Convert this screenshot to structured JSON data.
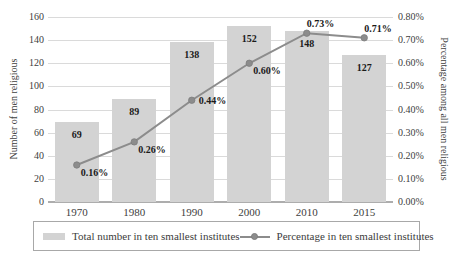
{
  "chart_data": {
    "type": "bar",
    "subtype": "bar-line-combo-dual-axis",
    "categories": [
      "1970",
      "1980",
      "1990",
      "2000",
      "2010",
      "2015"
    ],
    "series": [
      {
        "name": "Total number in ten smallest institutes",
        "type": "bar",
        "axis": "left",
        "values": [
          69,
          89,
          138,
          152,
          148,
          127
        ],
        "data_labels": [
          "69",
          "89",
          "138",
          "152",
          "148",
          "127"
        ]
      },
      {
        "name": "Percentage in ten smallest institutes",
        "type": "line",
        "axis": "right",
        "values": [
          0.16,
          0.26,
          0.44,
          0.6,
          0.73,
          0.71
        ],
        "data_labels": [
          "0.16%",
          "0.26%",
          "0.44%",
          "0.60%",
          "0.73%",
          "0.71%"
        ],
        "label_positions": [
          "below-right",
          "below-right",
          "right",
          "below-right",
          "above",
          "above"
        ]
      }
    ],
    "left_axis": {
      "title": "Number of men religious",
      "min": 0,
      "max": 160,
      "step": 20,
      "ticks": [
        "0",
        "20",
        "40",
        "60",
        "80",
        "100",
        "120",
        "140",
        "160"
      ]
    },
    "right_axis": {
      "title": "Percentage among all men religious",
      "min": 0,
      "max": 0.8,
      "step": 0.1,
      "ticks": [
        "0.00%",
        "0.10%",
        "0.20%",
        "0.30%",
        "0.40%",
        "0.50%",
        "0.60%",
        "0.70%",
        "0.80%"
      ]
    },
    "grid": "horizontal-on",
    "legend_position": "bottom",
    "colors": {
      "bar_fill": "#d3d3d3",
      "line": "#8c8c8c",
      "marker": "#8c8c8c",
      "gridline": "#dadada",
      "axis_line": "#adadad",
      "data_label": "#1a1a1a",
      "tick_label": "#404040",
      "legend_border": "#a8a8a8",
      "text": "#3c3c3c"
    }
  },
  "legend": {
    "items": [
      {
        "label": "Total number in ten smallest institutes",
        "swatch": "bar-swatch"
      },
      {
        "label": "Percentage in ten smallest institutes",
        "swatch": "line-marker-swatch"
      }
    ]
  }
}
